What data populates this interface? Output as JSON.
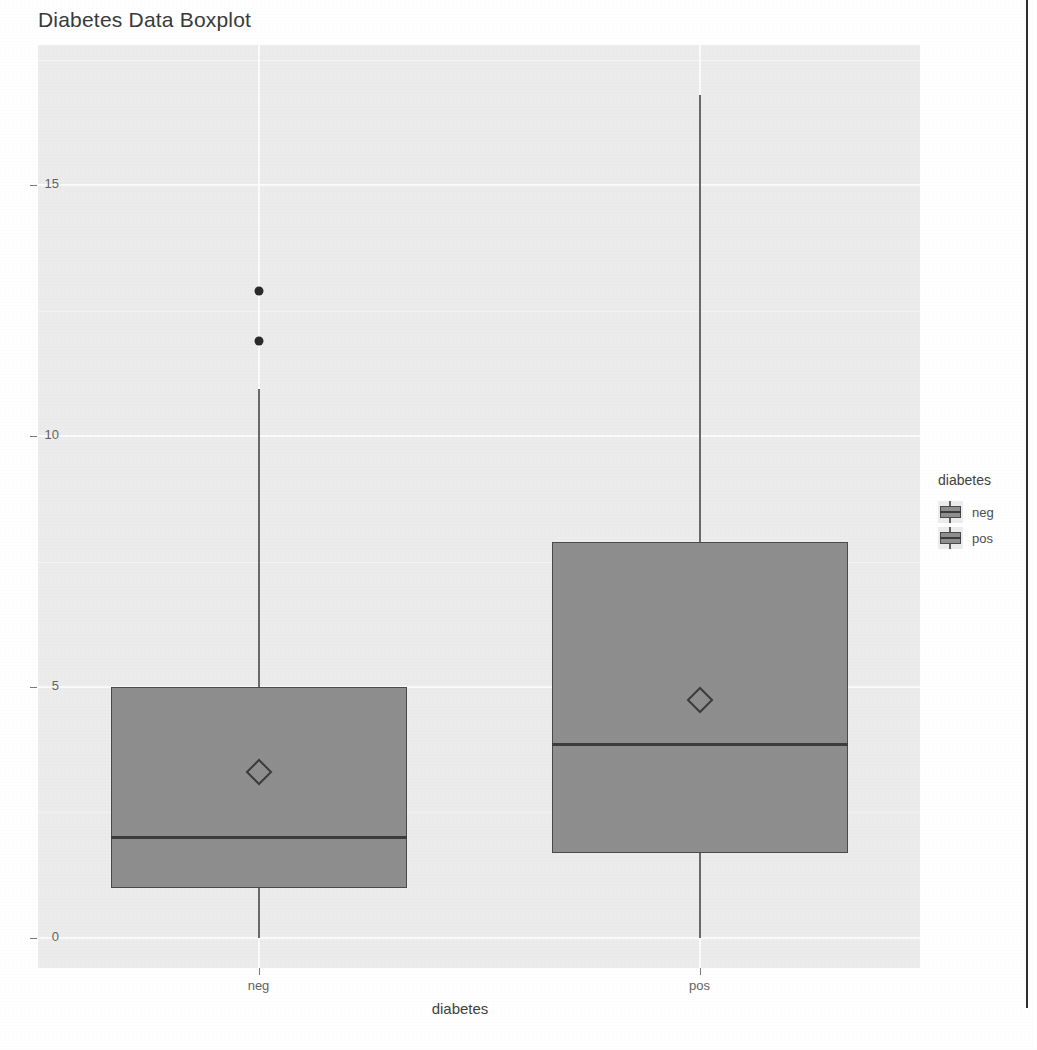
{
  "chart_data": {
    "type": "box",
    "title": "Diabetes Data Boxplot",
    "xlabel": "diabetes",
    "ylabel": "",
    "categories": [
      "neg",
      "pos"
    ],
    "ylim": [
      -0.6,
      17.8
    ],
    "yticks": [
      0,
      5,
      10,
      15
    ],
    "ytick_labels": [
      "0",
      "5",
      "10",
      "15"
    ],
    "grid": true,
    "legend": {
      "title": "diabetes",
      "position": "right",
      "entries": [
        {
          "label": "neg",
          "color": "#8e8e8e"
        },
        {
          "label": "pos",
          "color": "#8e8e8e"
        }
      ]
    },
    "boxes": [
      {
        "category": "neg",
        "whisker_low": 0.0,
        "q1": 1.0,
        "median": 2.0,
        "q3": 5.0,
        "whisker_high": 10.95,
        "mean": 3.3,
        "outliers": [
          12.9,
          11.9
        ]
      },
      {
        "category": "pos",
        "whisker_low": 0.0,
        "q1": 1.7,
        "median": 3.85,
        "q3": 7.9,
        "whisker_high": 16.8,
        "mean": 4.75,
        "outliers": []
      }
    ],
    "style": {
      "panel_background": "#ececec",
      "grid_color": "#fbfbfb",
      "box_fill": "#8e8e8e",
      "box_border": "#4a4a4a",
      "median_color": "#3c3c3c",
      "whisker_color": "#6a6a6a",
      "outlier_color": "#2b2b2b",
      "mean_marker": "diamond"
    }
  }
}
